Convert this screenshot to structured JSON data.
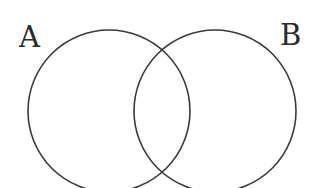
{
  "diagram": {
    "type": "venn",
    "sets": [
      {
        "label": "A",
        "cx": 109,
        "cy": 111,
        "r": 81
      },
      {
        "label": "B",
        "cx": 215,
        "cy": 111,
        "r": 81
      }
    ],
    "stroke_color": "#3a3a3a",
    "background": "#ffffff"
  }
}
